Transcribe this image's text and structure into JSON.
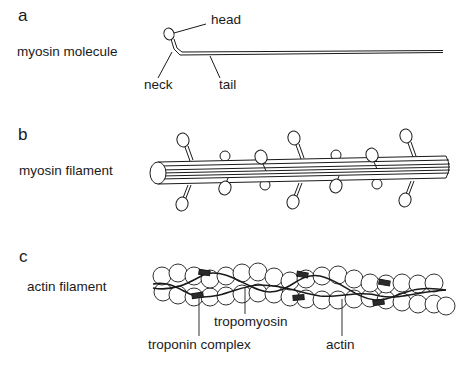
{
  "panels": {
    "a": {
      "letter": "a",
      "title": "myosin molecule",
      "labels": {
        "head": "head",
        "neck": "neck",
        "tail": "tail"
      }
    },
    "b": {
      "letter": "b",
      "title": "myosin filament"
    },
    "c": {
      "letter": "c",
      "title": "actin filament",
      "labels": {
        "tropomyosin": "tropomyosin",
        "troponin": "troponin complex",
        "actin": "actin"
      }
    }
  },
  "colors": {
    "ink": "#1a1a1a",
    "background": "#ffffff",
    "troponin_fill": "#2a2a2a"
  }
}
